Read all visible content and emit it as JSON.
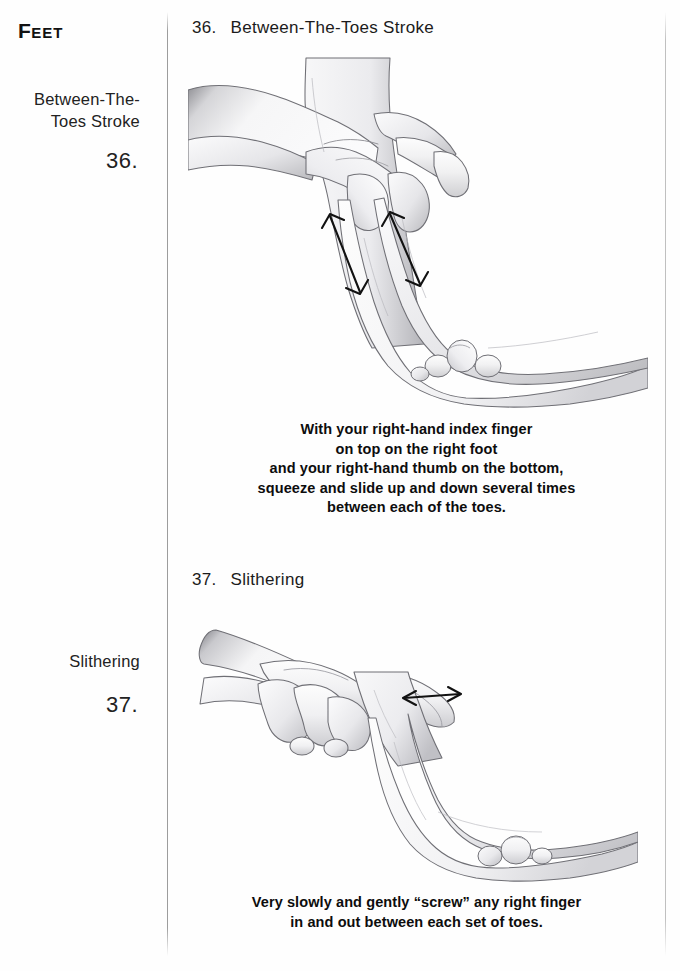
{
  "page": {
    "background_color": "#fefefe",
    "text_color": "#1a1a1a",
    "rule_color": "#8c8c8c"
  },
  "sidebar": {
    "section_title": {
      "cap": "F",
      "rest": "EET",
      "full": "FEET"
    },
    "entries": [
      {
        "label": "Between-The-\nToes Stroke",
        "label_line1": "Between-The-",
        "label_line2": "Toes Stroke",
        "number": "36."
      },
      {
        "label": "Slithering",
        "label_line1": "Slithering",
        "label_line2": "",
        "number": "37."
      }
    ]
  },
  "main": {
    "steps": [
      {
        "number": "36.",
        "title": "Between-The-Toes Stroke",
        "figure_alt": "Hand with index finger on top of the right foot and thumb beneath, squeezing between the toes; two diagonal double-headed arrows indicate up-and-down sliding.",
        "arrows": [
          {
            "type": "double-headed",
            "direction": "diagonal"
          },
          {
            "type": "double-headed",
            "direction": "diagonal"
          }
        ],
        "caption_lines": [
          "With your right-hand index finger",
          "on top on the right foot",
          "and your right-hand thumb on the bottom,",
          "squeeze and slide up and down several times",
          "between each of the toes."
        ]
      },
      {
        "number": "37.",
        "title": "Slithering",
        "figure_alt": "Hand with one finger screwing in and out between a set of toes on the right foot; one horizontal double-headed arrow.",
        "arrows": [
          {
            "type": "double-headed",
            "direction": "horizontal"
          }
        ],
        "caption_lines": [
          "Very slowly and gently “screw” any right finger",
          "in and out between each set of toes."
        ]
      }
    ]
  }
}
